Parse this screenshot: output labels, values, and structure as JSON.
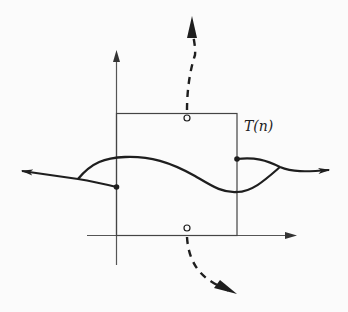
{
  "diagram": {
    "label": "T(n)",
    "colors": {
      "background": "#fbfbfb",
      "stroke": "#1e1e1e",
      "axis": "#555555"
    },
    "elements": {
      "axes": "vertical and horizontal coordinate axes with arrowheads",
      "box": "rectangular region bounded on bottom by horizontal axis",
      "curve": "wavy solid line crossing the box from left to right",
      "left_exit": "curve leaves left side; branch from filled dot merges and exits with arrow pointing left",
      "right_exit": "curve leaves right side; branch from filled dot merges and exits with arrow pointing right",
      "top_exit": "dashed arrow from open circle on top edge pointing up",
      "bottom_exit": "dashed arrow from open circle on bottom edge pointing down-right"
    }
  }
}
